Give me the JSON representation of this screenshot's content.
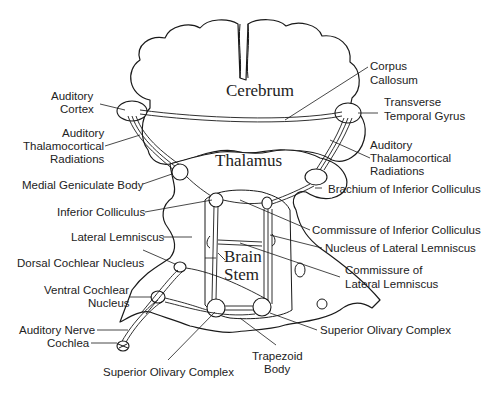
{
  "diagram": {
    "regions": {
      "cerebrum": "Cerebrum",
      "thalamus": "Thalamus",
      "brain_stem_line1": "Brain",
      "brain_stem_line2": "Stem"
    },
    "labels_left": {
      "auditory_cortex_1": "Auditory",
      "auditory_cortex_2": "Cortex",
      "thalamocortical_left_1": "Auditory",
      "thalamocortical_left_2": "Thalamocortical",
      "thalamocortical_left_3": "Radiations",
      "medial_geniculate_body": "Medial Geniculate Body",
      "inferior_colliculus": "Inferior Colliculus",
      "lateral_lemniscus": "Lateral Lemniscus",
      "dorsal_cochlear_nucleus": "Dorsal Cochlear Nucleus",
      "ventral_cochlear_nucleus_1": "Ventral Cochlear",
      "ventral_cochlear_nucleus_2": "Nucleus",
      "auditory_nerve": "Auditory Nerve",
      "cochlea": "Cochlea",
      "superior_olivary_complex_left": "Superior Olivary Complex"
    },
    "labels_right": {
      "corpus_callosum_1": "Corpus",
      "corpus_callosum_2": "Callosum",
      "transverse_temporal_gyrus_1": "Transverse",
      "transverse_temporal_gyrus_2": "Temporal Gyrus",
      "thalamocortical_right_1": "Auditory",
      "thalamocortical_right_2": "Thalamocortical",
      "thalamocortical_right_3": "Radiations",
      "brachium_inferior_colliculus": "Brachium of Inferior Colliculus",
      "commissure_inferior_colliculus": "Commissure of Inferior Colliculus",
      "nucleus_lateral_lemniscus": "Nucleus of Lateral Lemniscus",
      "commissure_lateral_lemniscus_1": "Commissure of",
      "commissure_lateral_lemniscus_2": "Lateral Lemniscus",
      "superior_olivary_complex_right": "Superior Olivary Complex",
      "trapezoid_body_1": "Trapezoid",
      "trapezoid_body_2": "Body"
    }
  }
}
